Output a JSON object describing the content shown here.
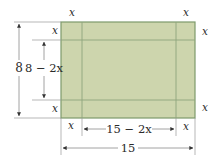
{
  "diagram": {
    "type": "box-from-sheet",
    "colors": {
      "sheet_fill": "#cdd5ad",
      "sheet_border": "#7d9a6c",
      "fold_line": "#8fa47d",
      "dimension_line": "#8a8a8a",
      "arrow": "#333333",
      "text": "#2a2a2a"
    },
    "labels": {
      "corner_x": "x",
      "outer_height": "8",
      "inner_height": "8 − 2x",
      "inner_width": "15 − 2x",
      "outer_width": "15"
    },
    "corner_labels": [
      {
        "position": "top-left-top",
        "text": "x"
      },
      {
        "position": "top-right-top",
        "text": "x"
      },
      {
        "position": "top-left-side",
        "text": "x"
      },
      {
        "position": "top-right-side",
        "text": "x"
      },
      {
        "position": "bottom-left-side",
        "text": "x"
      },
      {
        "position": "bottom-right-side",
        "text": "x"
      },
      {
        "position": "bottom-left-bottom",
        "text": "x"
      },
      {
        "position": "bottom-right-bottom",
        "text": "x"
      }
    ]
  }
}
